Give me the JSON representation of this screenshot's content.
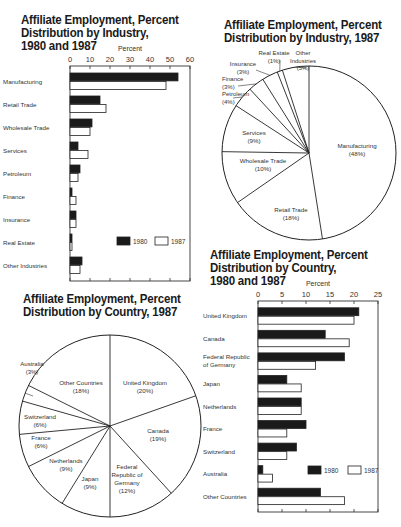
{
  "chart_data": [
    {
      "id": "industry_bar",
      "type": "bar",
      "orientation": "horizontal",
      "title": "Affiliate Employment, Percent\nDistribution by Industry,\n1980 and 1987",
      "xlabel": "Percent",
      "ylabel": "",
      "xlim": [
        0,
        60
      ],
      "xticks": [
        0,
        10,
        20,
        30,
        40,
        50,
        60
      ],
      "categories": [
        "Manufacturing",
        "Retail Trade",
        "Wholesale Trade",
        "Services",
        "Petroleum",
        "Finance",
        "Insurance",
        "Real Estate",
        "Other Industries"
      ],
      "series": [
        {
          "name": "1980",
          "color": "#1a1a1a",
          "values": [
            54,
            15,
            11,
            4,
            5,
            1,
            3,
            1,
            6
          ]
        },
        {
          "name": "1987",
          "color": "#ffffff",
          "values": [
            48,
            18,
            10,
            9,
            4,
            3,
            3,
            1,
            5
          ]
        }
      ],
      "legend": {
        "position": "inside-lower-right",
        "entries": [
          "1980",
          "1987"
        ]
      },
      "grid": false
    },
    {
      "id": "industry_pie",
      "type": "pie",
      "title": "Affiliate Employment, Percent\nDistribution by Industry, 1987",
      "slices": [
        {
          "label": "Manufacturing",
          "value": 48,
          "display": "(48%)"
        },
        {
          "label": "Retail Trade",
          "value": 18,
          "display": "(18%)"
        },
        {
          "label": "Wholesale Trade",
          "value": 10,
          "display": "(10%)"
        },
        {
          "label": "Services",
          "value": 9,
          "display": "(9%)"
        },
        {
          "label": "Petroleum",
          "value": 4,
          "display": "(4%)"
        },
        {
          "label": "Finance",
          "value": 3,
          "display": "(3%)"
        },
        {
          "label": "Insurance",
          "value": 3,
          "display": "(3%)"
        },
        {
          "label": "Real Estate",
          "value": 1,
          "display": "(1%)"
        },
        {
          "label": "Other Industries",
          "value": 5,
          "display": "(5%)"
        }
      ]
    },
    {
      "id": "country_bar",
      "type": "bar",
      "orientation": "horizontal",
      "title": "Affiliate Employment, Percent\nDistribution by Country,\n1980 and 1987",
      "xlabel": "Percent",
      "ylabel": "",
      "xlim": [
        0,
        25
      ],
      "xticks": [
        0,
        5,
        10,
        15,
        20,
        25
      ],
      "categories": [
        "United Kingdom",
        "Canada",
        "Federal Republic of Germany",
        "Japan",
        "Netherlands",
        "France",
        "Switzerland",
        "Australia",
        "Other Countries"
      ],
      "series": [
        {
          "name": "1980",
          "color": "#1a1a1a",
          "values": [
            21,
            14,
            18,
            6,
            9,
            10,
            8,
            1,
            13
          ]
        },
        {
          "name": "1987",
          "color": "#ffffff",
          "values": [
            20,
            19,
            12,
            9,
            9,
            6,
            6,
            3,
            18
          ]
        }
      ],
      "legend": {
        "position": "inside-lower-right",
        "entries": [
          "1980",
          "1987"
        ]
      },
      "grid": false
    },
    {
      "id": "country_pie",
      "type": "pie",
      "title": "Affiliate Employment, Percent\nDistribution by Country, 1987",
      "slices": [
        {
          "label": "United Kingdom",
          "value": 20,
          "display": "(20%)"
        },
        {
          "label": "Canada",
          "value": 19,
          "display": "(19%)"
        },
        {
          "label": "Federal Republic of Germany",
          "value": 12,
          "display": "(12%)"
        },
        {
          "label": "Japan",
          "value": 9,
          "display": "(9%)"
        },
        {
          "label": "Netherlands",
          "value": 9,
          "display": "(9%)"
        },
        {
          "label": "France",
          "value": 6,
          "display": "(6%)"
        },
        {
          "label": "Switzerland",
          "value": 6,
          "display": "(6%)"
        },
        {
          "label": "Australia",
          "value": 3,
          "display": "(3%)"
        },
        {
          "label": "Other Countries",
          "value": 18,
          "display": "(18%)"
        }
      ]
    }
  ],
  "titles": {
    "industry_bar": "Affiliate Employment, Percent\nDistribution by Industry,\n1980 and 1987",
    "industry_pie": "Affiliate Employment, Percent\nDistribution by Industry, 1987",
    "country_bar": "Affiliate Employment, Percent\nDistribution by Country,\n1980 and 1987",
    "country_pie": "Affiliate Employment, Percent\nDistribution by Country, 1987"
  }
}
